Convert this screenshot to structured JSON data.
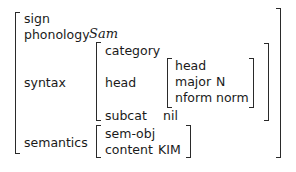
{
  "avm": {
    "type": "sign",
    "features": {
      "phonology": {
        "label": "phonology",
        "value": "Sam"
      },
      "syntax": {
        "label": "syntax",
        "type": "category",
        "head": {
          "label": "head",
          "type": "head",
          "major": {
            "label": "major",
            "value": "N"
          },
          "nform": {
            "label": "nform",
            "value": "norm"
          }
        },
        "subcat": {
          "label": "subcat",
          "value": "nil"
        }
      },
      "semantics": {
        "label": "semantics",
        "type": "sem-obj",
        "content": {
          "label": "content",
          "value": "KIM"
        }
      }
    }
  }
}
